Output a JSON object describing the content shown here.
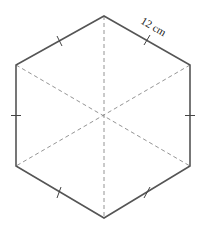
{
  "diagram": {
    "shape": "regular hexagon",
    "side_label": "12 cm",
    "colors": {
      "edge": "#555555",
      "diagonal": "#888888",
      "label": "#222222"
    },
    "vertices": [
      [
        104,
        16
      ],
      [
        190,
        65
      ],
      [
        190,
        166
      ],
      [
        104,
        218
      ],
      [
        16,
        166
      ],
      [
        16,
        65
      ]
    ],
    "center": [
      104,
      117
    ],
    "diagonals": "dashed lines from center to each vertex",
    "tick_marks": "one equal-length tick on each of the six sides"
  }
}
